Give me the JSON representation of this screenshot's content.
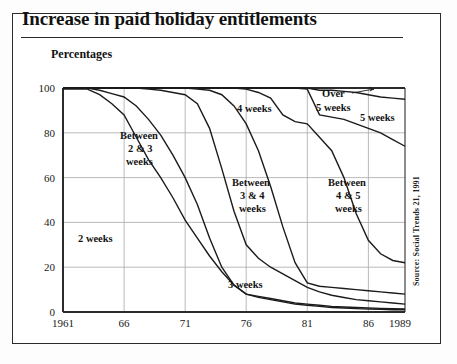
{
  "title": "Increase in paid holiday entitlements",
  "subtitle": "Percentages",
  "source": "Source: Social Trends 21, 1991",
  "colors": {
    "line": "#1b1b1b",
    "grid": "#a8a8a8",
    "axis": "#2b2b2b",
    "frame": "#2b2b2b",
    "background": "#ffffff"
  },
  "chart_data": {
    "type": "area",
    "title": "Increase in paid holiday entitlements",
    "subtitle": "Percentages",
    "xlabel": "",
    "ylabel": "Percentages",
    "xlim": [
      1961,
      1989
    ],
    "ylim": [
      0,
      100
    ],
    "grid": true,
    "legend_position": "inline-annotations",
    "x_ticks": [
      "1961",
      "66",
      "71",
      "76",
      "81",
      "86",
      "1989"
    ],
    "x_tick_values": [
      1961,
      1966,
      1971,
      1976,
      1981,
      1986,
      1989
    ],
    "y_ticks": [
      "0",
      "20",
      "40",
      "60",
      "80",
      "100"
    ],
    "y_tick_values": [
      0,
      20,
      40,
      60,
      80,
      100
    ],
    "note": "Cumulative percentage bands of full-time manual employees by length of paid holiday entitlement",
    "x": [
      1961,
      1962,
      1963,
      1964,
      1965,
      1966,
      1967,
      1968,
      1969,
      1970,
      1971,
      1972,
      1973,
      1974,
      1975,
      1976,
      1977,
      1978,
      1979,
      1980,
      1981,
      1982,
      1983,
      1984,
      1985,
      1986,
      1987,
      1988,
      1989
    ],
    "series": [
      {
        "name": "2 weeks",
        "label": "2 weeks",
        "label_x": 1963.6,
        "label_y": 35,
        "cumulative_upper": [
          99.5,
          99.5,
          99.5,
          97.0,
          93.0,
          88.0,
          78.0,
          68.0,
          60.0,
          51.0,
          41.0,
          33.0,
          25.0,
          18.0,
          12.0,
          8.0,
          6.5,
          5.5,
          4.5,
          3.5,
          3.0,
          2.5,
          2.0,
          1.8,
          1.5,
          1.3,
          1.2,
          1.0,
          1.0
        ]
      },
      {
        "name": "Between 2 & 3 weeks",
        "label": "Between 2 & 3 weeks",
        "label_x": 1967.4,
        "label_y": 76,
        "cumulative_upper": [
          100.0,
          100.0,
          100.0,
          99.0,
          97.5,
          96.0,
          92.0,
          86.0,
          79.0,
          70.0,
          60.0,
          48.0,
          33.0,
          20.0,
          12.0,
          8.0,
          7.0,
          6.0,
          5.0,
          4.0,
          3.5,
          3.0,
          2.5,
          2.2,
          2.0,
          1.8,
          1.6,
          1.5,
          1.4
        ]
      },
      {
        "name": "3 weeks",
        "label": "3 weeks",
        "label_x": 1975.4,
        "label_y": 15,
        "cumulative_upper": [
          100.0,
          100.0,
          100.0,
          100.0,
          100.0,
          100.0,
          100.0,
          99.5,
          99.0,
          98.0,
          97.0,
          93.0,
          82.0,
          64.0,
          45.0,
          30.0,
          24.0,
          20.0,
          17.0,
          14.0,
          11.0,
          9.0,
          7.5,
          6.5,
          5.5,
          5.0,
          4.5,
          4.0,
          3.5
        ]
      },
      {
        "name": "Between 3 & 4 weeks",
        "label": "Between 3 & 4 weeks",
        "label_x": 1977.3,
        "label_y": 58,
        "cumulative_upper": [
          100.0,
          100.0,
          100.0,
          100.0,
          100.0,
          100.0,
          100.0,
          100.0,
          100.0,
          100.0,
          100.0,
          99.5,
          99.0,
          97.0,
          92.0,
          84.0,
          72.0,
          56.0,
          38.0,
          22.0,
          13.0,
          11.5,
          11.0,
          10.5,
          10.0,
          9.5,
          9.0,
          8.5,
          8.0
        ]
      },
      {
        "name": "4 weeks",
        "label": "4 weeks",
        "label_x": 1973.3,
        "label_y": 91,
        "cumulative_upper": [
          100.0,
          100.0,
          100.0,
          100.0,
          100.0,
          100.0,
          100.0,
          100.0,
          100.0,
          100.0,
          100.0,
          100.0,
          100.0,
          100.0,
          100.0,
          99.5,
          98.0,
          95.5,
          88.0,
          85.0,
          84.0,
          78.0,
          72.0,
          60.0,
          44.0,
          32.0,
          26.0,
          23.0,
          22.0
        ]
      },
      {
        "name": "Between 4 & 5 weeks",
        "label": "Between 4 & 5 weeks",
        "label_x": 1982.4,
        "label_y": 58,
        "cumulative_upper": [
          100.0,
          100.0,
          100.0,
          100.0,
          100.0,
          100.0,
          100.0,
          100.0,
          100.0,
          100.0,
          100.0,
          100.0,
          100.0,
          100.0,
          100.0,
          100.0,
          100.0,
          100.0,
          100.0,
          100.0,
          99.5,
          88.0,
          87.0,
          86.0,
          84.0,
          82.0,
          80.0,
          77.0,
          74.0
        ]
      },
      {
        "name": "5 weeks",
        "label": "5 weeks",
        "label_x": 1985.6,
        "label_y": 92,
        "cumulative_upper": [
          100.0,
          100.0,
          100.0,
          100.0,
          100.0,
          100.0,
          100.0,
          100.0,
          100.0,
          100.0,
          100.0,
          100.0,
          100.0,
          100.0,
          100.0,
          100.0,
          100.0,
          100.0,
          100.0,
          100.0,
          100.0,
          99.0,
          99.0,
          98.5,
          98.0,
          97.0,
          96.0,
          95.5,
          95.0
        ]
      },
      {
        "name": "Over 5 weeks",
        "label": "Over 5 weeks",
        "label_x": 1981.3,
        "label_y": 96,
        "cumulative_upper": [
          100.0,
          100.0,
          100.0,
          100.0,
          100.0,
          100.0,
          100.0,
          100.0,
          100.0,
          100.0,
          100.0,
          100.0,
          100.0,
          100.0,
          100.0,
          100.0,
          100.0,
          100.0,
          100.0,
          100.0,
          100.0,
          100.0,
          100.0,
          100.0,
          100.0,
          100.0,
          100.0,
          100.0,
          100.0
        ]
      }
    ]
  },
  "annotations": [
    {
      "id": "ann-2-weeks",
      "text": "2 weeks"
    },
    {
      "id": "ann-between-2-3",
      "line1": "Between",
      "line2": "2 & 3",
      "line3": "weeks"
    },
    {
      "id": "ann-3-weeks",
      "text": "3 weeks"
    },
    {
      "id": "ann-between-3-4",
      "line1": "Between",
      "line2": "3 & 4",
      "line3": "weeks"
    },
    {
      "id": "ann-4-weeks",
      "text": "4 weeks"
    },
    {
      "id": "ann-between-4-5",
      "line1": "Between",
      "line2": "4 & 5",
      "line3": "weeks"
    },
    {
      "id": "ann-5-weeks",
      "text": "5 weeks"
    },
    {
      "id": "ann-over-5",
      "line1": "Over",
      "line2": "5 weeks"
    }
  ],
  "labels": {
    "ann_2_weeks": "2 weeks",
    "ann_b23_l1": "Between",
    "ann_b23_l2": "2 & 3",
    "ann_b23_l3": "weeks",
    "ann_3_weeks": "3 weeks",
    "ann_b34_l1": "Between",
    "ann_b34_l2": "3 & 4",
    "ann_b34_l3": "weeks",
    "ann_4_weeks": "4 weeks",
    "ann_b45_l1": "Between",
    "ann_b45_l2": "4 & 5",
    "ann_b45_l3": "weeks",
    "ann_5_weeks": "5 weeks",
    "ann_over5_l1": "Over",
    "ann_over5_l2": "5 weeks",
    "y_100": "100",
    "y_80": "80",
    "y_60": "60",
    "y_40": "40",
    "y_20": "20",
    "y_0": "0",
    "x_1961": "1961",
    "x_66": "66",
    "x_71": "71",
    "x_76": "76",
    "x_81": "81",
    "x_86": "86",
    "x_1989": "1989"
  }
}
